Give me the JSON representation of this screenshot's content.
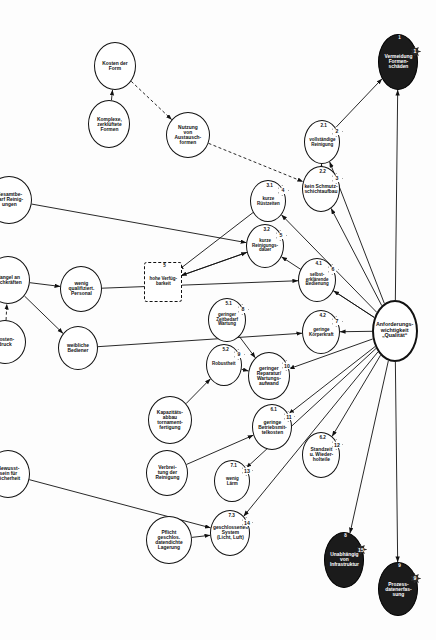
{
  "diagram": {
    "type": "influence-network",
    "orientation": "rotated-90",
    "legend": {
      "solid_arrow": "verstärkende Wirkung",
      "dashed_arrow": "abschwächende Wirkung"
    },
    "nodes": [
      {
        "id": "root",
        "label": "Anforderungs-\nwichtigkeit\n„Qualität“",
        "badge": "",
        "style": "thick",
        "x": 300,
        "y": 18,
        "w": 62,
        "h": 46
      },
      {
        "id": "n1",
        "label": "Vermeidung\nFormen-\nschäden",
        "idx": "1",
        "badge": "1",
        "style": "dark",
        "x": 34,
        "y": 18,
        "w": 56,
        "h": 40
      },
      {
        "id": "n9",
        "label": "Prozess-\ndatenerfas-\nsung",
        "idx": "9",
        "badge": "9",
        "style": "dark",
        "x": 562,
        "y": 18,
        "w": 54,
        "h": 40
      },
      {
        "id": "n8",
        "label": "Unabhängig\nvon\nInfrastruktur",
        "idx": "8",
        "badge": "15",
        "style": "dark",
        "x": 532,
        "y": 72,
        "w": 56,
        "h": 40
      },
      {
        "id": "n21",
        "label": "vollständige\nReinigung",
        "idx": "2.1",
        "badge": "2",
        "style": "plain",
        "x": 120,
        "y": 96,
        "w": 44,
        "h": 36
      },
      {
        "id": "n22",
        "label": "kein Schmutz-\nschichtaufbau",
        "idx": "2.2",
        "badge": "3",
        "style": "plain",
        "x": 166,
        "y": 96,
        "w": 46,
        "h": 38
      },
      {
        "id": "n41",
        "label": "selbst-\nerklärende\nBedienung",
        "idx": "4.1",
        "badge": "6",
        "style": "plain",
        "x": 258,
        "y": 100,
        "w": 44,
        "h": 38
      },
      {
        "id": "n42",
        "label": "geringe\nKörperkraft",
        "idx": "4.2",
        "badge": "7",
        "style": "plain",
        "x": 310,
        "y": 96,
        "w": 44,
        "h": 38
      },
      {
        "id": "n62",
        "label": "Standzeit\nu. Wieder-\nholteile",
        "idx": "6.2",
        "badge": "12",
        "style": "plain",
        "x": 432,
        "y": 96,
        "w": 46,
        "h": 38
      },
      {
        "id": "n61",
        "label": "geringe\nBetriebsmit-\ntelkosten",
        "idx": "6.1",
        "badge": "11",
        "style": "plain",
        "x": 404,
        "y": 144,
        "w": 46,
        "h": 40
      },
      {
        "id": "n10",
        "label": "geringer\nReparatur/\nWartungs-\naufwand",
        "idx": "",
        "badge": "10",
        "style": "plain",
        "x": 352,
        "y": 146,
        "w": 48,
        "h": 42
      },
      {
        "id": "n31",
        "label": "kurze\nRüstzeiten",
        "idx": "3.1",
        "badge": "4",
        "style": "plain",
        "x": 180,
        "y": 150,
        "w": 42,
        "h": 36
      },
      {
        "id": "n32",
        "label": "kurze\nReinigungs-\ndauer",
        "idx": "3.2",
        "badge": "5",
        "style": "plain",
        "x": 224,
        "y": 152,
        "w": 44,
        "h": 38
      },
      {
        "id": "n51",
        "label": "geringer\nZeitbedarf\nWartung",
        "idx": "5.1",
        "badge": "8",
        "style": "plain",
        "x": 298,
        "y": 190,
        "w": 44,
        "h": 38
      },
      {
        "id": "n52",
        "label": "Robustheit",
        "idx": "5.2",
        "badge": "9",
        "style": "plain",
        "x": 344,
        "y": 194,
        "w": 42,
        "h": 36
      },
      {
        "id": "n71",
        "label": "wenig\nLärm",
        "idx": "7.1",
        "badge": "13",
        "style": "plain",
        "x": 460,
        "y": 186,
        "w": 42,
        "h": 36
      },
      {
        "id": "n73",
        "label": "geschlossenes\nSystem\n(Licht, Luft)",
        "idx": "7.3",
        "badge": "14",
        "style": "plain",
        "x": 510,
        "y": 186,
        "w": 46,
        "h": 40
      },
      {
        "id": "n5",
        "label": "hohe Verfüg-\nbarkeit",
        "idx": "5",
        "badge": "",
        "style": "boxdash",
        "x": 262,
        "y": 254,
        "w": 40,
        "h": 38
      },
      {
        "id": "nutz",
        "label": "Nutzung\nvon\nAustausch-\nformen",
        "idx": "",
        "badge": "",
        "style": "plain",
        "x": 112,
        "y": 226,
        "w": 46,
        "h": 44
      },
      {
        "id": "kapa",
        "label": "Kapazitäts-\nabbau\ntornament-\nfertigung",
        "idx": "",
        "badge": "",
        "style": "plain",
        "x": 396,
        "y": 244,
        "w": 48,
        "h": 44
      },
      {
        "id": "verbr",
        "label": "Verbrei-\ntung der\nReinigung",
        "idx": "",
        "badge": "",
        "style": "plain",
        "x": 450,
        "y": 248,
        "w": 46,
        "h": 42
      },
      {
        "id": "pfl",
        "label": "Pflicht\ngeschlos.\ndatendichte\nLagerung",
        "idx": "",
        "badge": "",
        "style": "plain",
        "x": 516,
        "y": 244,
        "w": 48,
        "h": 46
      },
      {
        "id": "kform",
        "label": "Kosten der\nForm",
        "idx": "",
        "badge": "",
        "style": "plain",
        "x": 42,
        "y": 300,
        "w": 48,
        "h": 42
      },
      {
        "id": "kompl",
        "label": "Komplexe,\nzerklüftete\nFormen",
        "idx": "",
        "badge": "",
        "style": "plain",
        "x": 100,
        "y": 306,
        "w": 48,
        "h": 42
      },
      {
        "id": "wenigq",
        "label": "wenig\nqualifiziert.\nPersonal",
        "idx": "",
        "badge": "",
        "style": "plain",
        "x": 266,
        "y": 334,
        "w": 46,
        "h": 42
      },
      {
        "id": "weib",
        "label": "weibliche\nBediener",
        "idx": "",
        "badge": "",
        "style": "plain",
        "x": 326,
        "y": 338,
        "w": 44,
        "h": 40
      },
      {
        "id": "gesamt",
        "label": "Gesamtbe-\ndarf Reinig-\nungen",
        "idx": "",
        "badge": "",
        "style": "plain",
        "x": 176,
        "y": 404,
        "w": 48,
        "h": 46
      },
      {
        "id": "mangel",
        "label": "Mangel an\nFachkräften",
        "idx": "",
        "badge": "",
        "style": "plain",
        "x": 256,
        "y": 406,
        "w": 48,
        "h": 44
      },
      {
        "id": "kostd",
        "label": "Kosten-\ndruck",
        "idx": "",
        "badge": "",
        "style": "plain",
        "x": 320,
        "y": 410,
        "w": 44,
        "h": 42
      },
      {
        "id": "bewsi",
        "label": "Bewusst-\nsein für\nSicherheit",
        "idx": "",
        "badge": "",
        "style": "plain",
        "x": 450,
        "y": 406,
        "w": 48,
        "h": 44
      },
      {
        "id": "energ",
        "label": "Energie-\nkosten",
        "idx": "",
        "badge": "",
        "style": "plain",
        "x": 396,
        "y": 468,
        "w": 46,
        "h": 42
      },
      {
        "id": "nachfr",
        "label": "Nachfrage\nGummi-\nartikel",
        "idx": "",
        "badge": "",
        "style": "plain",
        "x": 236,
        "y": 486,
        "w": 48,
        "h": 44
      },
      {
        "id": "einka",
        "label": "Einkauf-\ngenossen-\nschaften",
        "idx": "",
        "badge": "",
        "style": "plain",
        "x": 470,
        "y": 500,
        "w": 48,
        "h": 44
      },
      {
        "id": "qualb",
        "label": "Qualitäts-\nbewusst-\nsein",
        "idx": "",
        "badge": "",
        "style": "plain",
        "x": 56,
        "y": 556,
        "w": 48,
        "h": 46
      },
      {
        "id": "zahl",
        "label": "Zahl der\nHeizzyklen\nzw.\nReinigung",
        "idx": "",
        "badge": "",
        "style": "plain",
        "x": 136,
        "y": 552,
        "w": 50,
        "h": 50
      },
      {
        "id": "wachs",
        "label": "Wachstum\nWelt-\nwirtschaft",
        "idx": "",
        "badge": "",
        "style": "plain",
        "x": 306,
        "y": 552,
        "w": 48,
        "h": 46
      },
      {
        "id": "umwe",
        "label": "Umwelt-\nbewusstsein",
        "idx": "",
        "badge": "",
        "style": "plain",
        "x": 400,
        "y": 558,
        "w": 48,
        "h": 44
      }
    ],
    "edges": [
      {
        "from": "root",
        "to": "n1",
        "kind": "solid"
      },
      {
        "from": "root",
        "to": "n21",
        "kind": "solid"
      },
      {
        "from": "root",
        "to": "n22",
        "kind": "solid"
      },
      {
        "from": "root",
        "to": "n31",
        "kind": "solid"
      },
      {
        "from": "root",
        "to": "n32",
        "kind": "solid"
      },
      {
        "from": "root",
        "to": "n41",
        "kind": "solid"
      },
      {
        "from": "root",
        "to": "n42",
        "kind": "solid"
      },
      {
        "from": "root",
        "to": "n10",
        "kind": "solid"
      },
      {
        "from": "root",
        "to": "n61",
        "kind": "solid"
      },
      {
        "from": "root",
        "to": "n62",
        "kind": "solid"
      },
      {
        "from": "root",
        "to": "n71",
        "kind": "solid"
      },
      {
        "from": "root",
        "to": "n73",
        "kind": "solid"
      },
      {
        "from": "root",
        "to": "n8",
        "kind": "solid"
      },
      {
        "from": "root",
        "to": "n9",
        "kind": "solid"
      },
      {
        "from": "n21",
        "to": "n1",
        "kind": "solid"
      },
      {
        "from": "n22",
        "to": "n21",
        "kind": "solid"
      },
      {
        "from": "nutz",
        "to": "n22",
        "kind": "dashed"
      },
      {
        "from": "n31",
        "to": "n5",
        "kind": "solid"
      },
      {
        "from": "n32",
        "to": "n5",
        "kind": "solid"
      },
      {
        "from": "n51",
        "to": "n10",
        "kind": "solid"
      },
      {
        "from": "n52",
        "to": "n10",
        "kind": "solid"
      },
      {
        "from": "n5",
        "to": "n32",
        "kind": "solid"
      },
      {
        "from": "kform",
        "to": "nutz",
        "kind": "dashed"
      },
      {
        "from": "kompl",
        "to": "kform",
        "kind": "solid"
      },
      {
        "from": "gesamt",
        "to": "n32",
        "kind": "solid"
      },
      {
        "from": "wenigq",
        "to": "n41",
        "kind": "solid"
      },
      {
        "from": "weib",
        "to": "n42",
        "kind": "solid"
      },
      {
        "from": "mangel",
        "to": "wenigq",
        "kind": "solid"
      },
      {
        "from": "mangel",
        "to": "weib",
        "kind": "solid"
      },
      {
        "from": "kostd",
        "to": "mangel",
        "kind": "dashed"
      },
      {
        "from": "zahl",
        "to": "gesamt",
        "kind": "dashed"
      },
      {
        "from": "qualb",
        "to": "zahl",
        "kind": "dashed"
      },
      {
        "from": "nachfr",
        "to": "gesamt",
        "kind": "solid"
      },
      {
        "from": "wachs",
        "to": "nachfr",
        "kind": "solid"
      },
      {
        "from": "energ",
        "to": "kostd",
        "kind": "dashed"
      },
      {
        "from": "umwe",
        "to": "energ",
        "kind": "solid"
      },
      {
        "from": "bewsi",
        "to": "n73",
        "kind": "solid"
      },
      {
        "from": "pfl",
        "to": "n73",
        "kind": "solid"
      },
      {
        "from": "verbr",
        "to": "n61",
        "kind": "solid"
      },
      {
        "from": "kapa",
        "to": "n52",
        "kind": "solid"
      },
      {
        "from": "einka",
        "to": "bewsi",
        "kind": "solid"
      }
    ]
  }
}
